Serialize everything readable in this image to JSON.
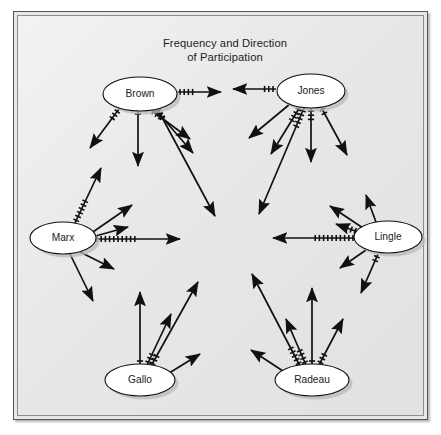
{
  "figure": {
    "title_line1": "Frequency and Direction",
    "title_line2": "of Participation",
    "panel_background": "#e8e8e8",
    "panel_border": "#55565a",
    "ink_color": "#111111",
    "node_fill": "#ffffff"
  },
  "nodes": [
    {
      "id": "brown",
      "label": "Brown",
      "cx": 122,
      "cy": 78,
      "rx": 37,
      "ry": 17
    },
    {
      "id": "jones",
      "label": "Jones",
      "cx": 293,
      "cy": 75,
      "rx": 34,
      "ry": 17
    },
    {
      "id": "marx",
      "label": "Marx",
      "cx": 45,
      "cy": 222,
      "rx": 33,
      "ry": 16
    },
    {
      "id": "lingle",
      "label": "Lingle",
      "cx": 370,
      "cy": 221,
      "rx": 34,
      "ry": 16
    },
    {
      "id": "gallo",
      "label": "Gallo",
      "cx": 122,
      "cy": 364,
      "rx": 35,
      "ry": 16
    },
    {
      "id": "radeau",
      "label": "Radeau",
      "cx": 294,
      "cy": 364,
      "rx": 37,
      "ry": 16
    }
  ],
  "chart_data": {
    "type": "diagram",
    "diagram_kind": "sociogram",
    "title": "Frequency and Direction of Participation",
    "legend_note": "Tick marks on each arrow denote the frequency of participation; the arrowhead denotes the direction.",
    "actors": [
      "Brown",
      "Jones",
      "Marx",
      "Lingle",
      "Gallo",
      "Radeau"
    ],
    "edges": [
      {
        "from": "brown",
        "x1": 159,
        "y1": 76,
        "x2": 203,
        "y2": 76,
        "ticks": 4
      },
      {
        "from": "brown",
        "x1": 101,
        "y1": 93,
        "x2": 72,
        "y2": 132,
        "ticks": 3
      },
      {
        "from": "brown",
        "x1": 120,
        "y1": 95,
        "x2": 120,
        "y2": 150,
        "ticks": 1
      },
      {
        "from": "brown",
        "x1": 133,
        "y1": 94,
        "x2": 172,
        "y2": 123,
        "ticks": 3
      },
      {
        "from": "brown",
        "x1": 137,
        "y1": 93,
        "x2": 175,
        "y2": 137,
        "ticks": 3
      },
      {
        "from": "brown",
        "x1": 139,
        "y1": 92,
        "x2": 197,
        "y2": 200,
        "ticks": 3
      },
      {
        "from": "jones",
        "x1": 258,
        "y1": 73,
        "x2": 215,
        "y2": 73,
        "ticks": 3
      },
      {
        "from": "jones",
        "x1": 272,
        "y1": 88,
        "x2": 231,
        "y2": 122,
        "ticks": 0
      },
      {
        "from": "jones",
        "x1": 282,
        "y1": 91,
        "x2": 253,
        "y2": 138,
        "ticks": 4
      },
      {
        "from": "jones",
        "x1": 286,
        "y1": 92,
        "x2": 241,
        "y2": 198,
        "ticks": 5
      },
      {
        "from": "jones",
        "x1": 293,
        "y1": 92,
        "x2": 293,
        "y2": 146,
        "ticks": 3
      },
      {
        "from": "jones",
        "x1": 303,
        "y1": 91,
        "x2": 329,
        "y2": 139,
        "ticks": 2
      },
      {
        "from": "marx",
        "x1": 57,
        "y1": 207,
        "x2": 83,
        "y2": 152,
        "ticks": 6
      },
      {
        "from": "marx",
        "x1": 72,
        "y1": 218,
        "x2": 114,
        "y2": 189,
        "ticks": 0
      },
      {
        "from": "marx",
        "x1": 74,
        "y1": 221,
        "x2": 110,
        "y2": 211,
        "ticks": 0
      },
      {
        "from": "marx",
        "x1": 76,
        "y1": 223,
        "x2": 162,
        "y2": 223,
        "ticks": 10
      },
      {
        "from": "marx",
        "x1": 62,
        "y1": 236,
        "x2": 96,
        "y2": 253,
        "ticks": 0
      },
      {
        "from": "marx",
        "x1": 52,
        "y1": 238,
        "x2": 75,
        "y2": 285,
        "ticks": 0
      },
      {
        "from": "lingle",
        "x1": 358,
        "y1": 206,
        "x2": 348,
        "y2": 179,
        "ticks": 0
      },
      {
        "from": "lingle",
        "x1": 345,
        "y1": 212,
        "x2": 312,
        "y2": 190,
        "ticks": 0
      },
      {
        "from": "lingle",
        "x1": 340,
        "y1": 216,
        "x2": 318,
        "y2": 208,
        "ticks": 3
      },
      {
        "from": "lingle",
        "x1": 338,
        "y1": 222,
        "x2": 255,
        "y2": 222,
        "ticks": 10
      },
      {
        "from": "lingle",
        "x1": 348,
        "y1": 234,
        "x2": 322,
        "y2": 252,
        "ticks": 0
      },
      {
        "from": "lingle",
        "x1": 360,
        "y1": 238,
        "x2": 343,
        "y2": 277,
        "ticks": 2
      },
      {
        "from": "gallo",
        "x1": 122,
        "y1": 348,
        "x2": 122,
        "y2": 276,
        "ticks": 1
      },
      {
        "from": "gallo",
        "x1": 129,
        "y1": 349,
        "x2": 153,
        "y2": 298,
        "ticks": 3
      },
      {
        "from": "gallo",
        "x1": 133,
        "y1": 350,
        "x2": 180,
        "y2": 266,
        "ticks": 3
      },
      {
        "from": "gallo",
        "x1": 148,
        "y1": 359,
        "x2": 182,
        "y2": 338,
        "ticks": 0
      },
      {
        "from": "radeau",
        "x1": 282,
        "y1": 350,
        "x2": 234,
        "y2": 258,
        "ticks": 5
      },
      {
        "from": "radeau",
        "x1": 288,
        "y1": 349,
        "x2": 268,
        "y2": 303,
        "ticks": 4
      },
      {
        "from": "radeau",
        "x1": 294,
        "y1": 348,
        "x2": 294,
        "y2": 272,
        "ticks": 1
      },
      {
        "from": "radeau",
        "x1": 301,
        "y1": 349,
        "x2": 325,
        "y2": 303,
        "ticks": 3
      },
      {
        "from": "radeau",
        "x1": 268,
        "y1": 357,
        "x2": 233,
        "y2": 334,
        "ticks": 0
      }
    ]
  }
}
